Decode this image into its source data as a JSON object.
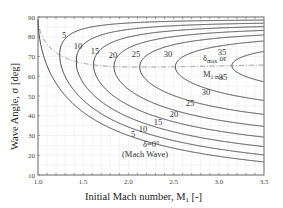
{
  "chart_data": {
    "type": "line",
    "title": "",
    "xlabel": "Initial Mach number, M1 [-]",
    "ylabel": "Wave Angle, σ [deg]",
    "xlim": [
      1.0,
      3.5
    ],
    "ylim": [
      10,
      90
    ],
    "x_ticks": [
      "1.0",
      "1.5",
      "2.0",
      "2.5",
      "3.0",
      "3.5"
    ],
    "y_ticks": [
      "10",
      "20",
      "30",
      "40",
      "50",
      "60",
      "70",
      "80",
      "90"
    ],
    "grid": true,
    "series": [
      {
        "name": "δ=0° (Mach Wave)",
        "deflection_deg": 0
      },
      {
        "name": "5",
        "deflection_deg": 5
      },
      {
        "name": "10",
        "deflection_deg": 10
      },
      {
        "name": "15",
        "deflection_deg": 15
      },
      {
        "name": "20",
        "deflection_deg": 20
      },
      {
        "name": "25",
        "deflection_deg": 25
      },
      {
        "name": "30",
        "deflection_deg": 30
      },
      {
        "name": "35",
        "deflection_deg": 35
      }
    ],
    "dashed_line": {
      "name": "δmax or M1 min",
      "style": "dash-dot"
    },
    "annotations": [
      {
        "text": "δmax or",
        "x": 2.85,
        "y": 70
      },
      {
        "text": "M1 min",
        "x": 2.85,
        "y": 62
      },
      {
        "text": "δ=0°",
        "x": 2.05,
        "y": 25
      },
      {
        "text": "(Mach Wave)",
        "x": 2.05,
        "y": 20
      }
    ]
  },
  "labels": {
    "xlabel_main": "Initial Mach number, M",
    "xlabel_sub": "1",
    "xlabel_tail": " [-]",
    "ylabel": "Wave Angle, σ [deg]",
    "annot_dmax": "δ",
    "annot_dmax_sub": "max",
    "annot_or": " or",
    "annot_m1": "M",
    "annot_m1_sub": "1 min",
    "annot_delta0": "δ=0°",
    "annot_mach_wave": "(Mach Wave)"
  }
}
